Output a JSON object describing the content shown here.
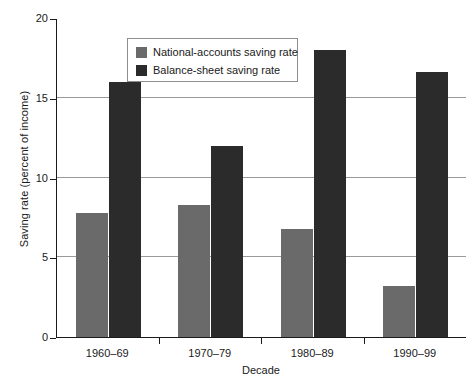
{
  "chart_data": {
    "type": "bar",
    "title": "",
    "subtitle": "",
    "xlabel": "Decade",
    "ylabel": "Saving rate (percent of income)",
    "categories": [
      "1960–69",
      "1970–79",
      "1980–89",
      "1990–99"
    ],
    "series": [
      {
        "name": "National-accounts saving rate",
        "color": "#6a6a6a",
        "values": [
          7.8,
          8.3,
          6.8,
          3.2
        ]
      },
      {
        "name": "Balance-sheet saving rate",
        "color": "#2b2b2b",
        "values": [
          16.0,
          12.0,
          18.0,
          16.6
        ]
      }
    ],
    "ylim": [
      0,
      20
    ],
    "yticks": [
      0,
      5,
      10,
      15,
      20
    ],
    "ytick_labels": [
      "0",
      "5",
      "10",
      "15",
      "20"
    ],
    "grid": true,
    "gridlines_at": [
      5,
      10,
      15
    ],
    "legend_position": "upper-left-inside",
    "axis_color": "#1a1a1a",
    "grid_color": "#9a9a9a",
    "background": "#ffffff"
  },
  "legend": {
    "entries": [
      {
        "label": "National-accounts saving rate",
        "color": "#6a6a6a"
      },
      {
        "label": "Balance-sheet saving rate",
        "color": "#2b2b2b"
      }
    ]
  }
}
